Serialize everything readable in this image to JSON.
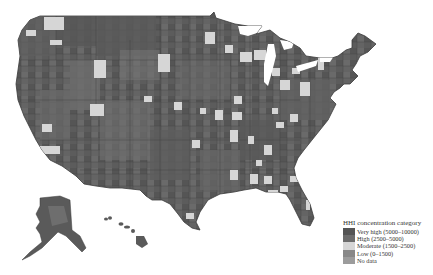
{
  "map": {
    "type": "choropleth",
    "subject": "US counties HHI concentration category",
    "regions_shown": [
      "contiguous-us",
      "alaska",
      "hawaii"
    ]
  },
  "legend": {
    "title": "HHI concentration category",
    "items": [
      {
        "label": "Very high (5000–10000)",
        "color": "#545454"
      },
      {
        "label": "High (2500–5000)",
        "color": "#6c6c6c"
      },
      {
        "label": "Moderate (1500–2500)",
        "color": "#d6d6d6"
      },
      {
        "label": "Low (0–1500)",
        "color": "#888888"
      },
      {
        "label": "No data",
        "color": "#9c9c9c"
      }
    ]
  },
  "colors": {
    "background": "#ffffff",
    "border": "#3a3a3a"
  }
}
